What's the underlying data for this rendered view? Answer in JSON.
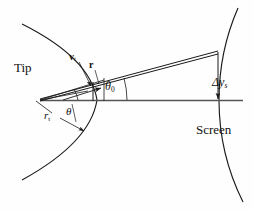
{
  "figure": {
    "kind": "geometry-diagram",
    "title_visible": false,
    "background_color": "#fefefe",
    "stroke_color": "#1a1a1a",
    "labels": {
      "tip": "Tip",
      "screen": "Screen",
      "velocity_tangential": "v",
      "velocity_tangential_sub": "t",
      "radius_vector": "r",
      "tip_radius": "r",
      "tip_radius_sub": "t",
      "angle_theta": "θ",
      "angle_theta0": "θ",
      "angle_theta0_sub": "0",
      "delta_y_screen": "Δy",
      "delta_y_screen_sub": "s"
    },
    "geometry": {
      "apex_x": 40,
      "apex_y": 100,
      "axis_y": 100,
      "axis_start_x": 40,
      "axis_end_x": 243,
      "tip_arc_center_x": 205,
      "tip_arc_radius": 168,
      "screen_arc_center_x": -178,
      "screen_arc_radius": 420,
      "ray_angle_deg": 13.5,
      "dys_drop_top_y": 51,
      "dys_drop_bottom_y": 100
    }
  }
}
